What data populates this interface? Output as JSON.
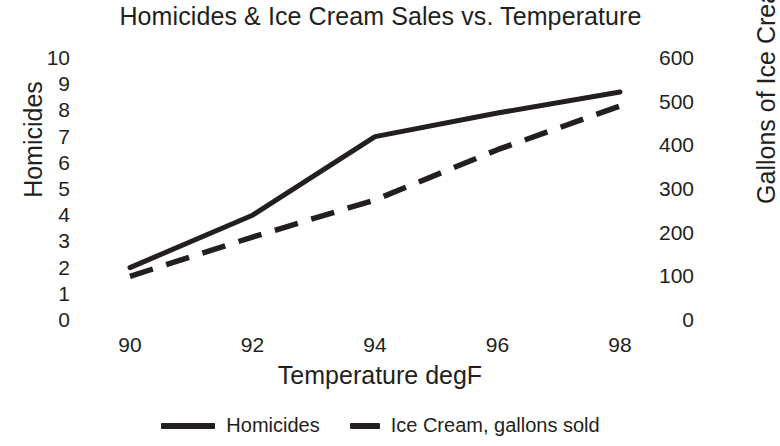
{
  "chart_data": {
    "type": "line",
    "title": "Homicides & Ice Cream Sales vs. Temperature",
    "xlabel": "Temperature degF",
    "ylabel": "Homicides",
    "y2label": "Gallons of Ice Cream",
    "x": [
      90,
      92,
      94,
      96,
      98
    ],
    "xticks": [
      "90",
      "92",
      "94",
      "96",
      "98"
    ],
    "xlim": [
      89,
      99
    ],
    "ylim": [
      0,
      10
    ],
    "yticks": [
      "10",
      "9",
      "8",
      "7",
      "6",
      "5",
      "4",
      "3",
      "2",
      "1",
      "0"
    ],
    "y2lim": [
      0,
      600
    ],
    "y2ticks": [
      "600",
      "500",
      "400",
      "300",
      "200",
      "100",
      "0"
    ],
    "grid": false,
    "legend_position": "bottom",
    "line_color": "#231f20",
    "series": [
      {
        "name": "Homicides",
        "axis": "left",
        "style": "solid",
        "values": [
          2,
          4,
          7,
          7.9,
          8.7
        ]
      },
      {
        "name": "Ice Cream, gallons sold",
        "axis": "right",
        "style": "dashed",
        "values": [
          100,
          190,
          275,
          390,
          490
        ]
      }
    ]
  },
  "legend": {
    "items": [
      {
        "label": "Homicides",
        "style": "solid"
      },
      {
        "label": "Ice Cream, gallons sold",
        "style": "dashed"
      }
    ]
  }
}
